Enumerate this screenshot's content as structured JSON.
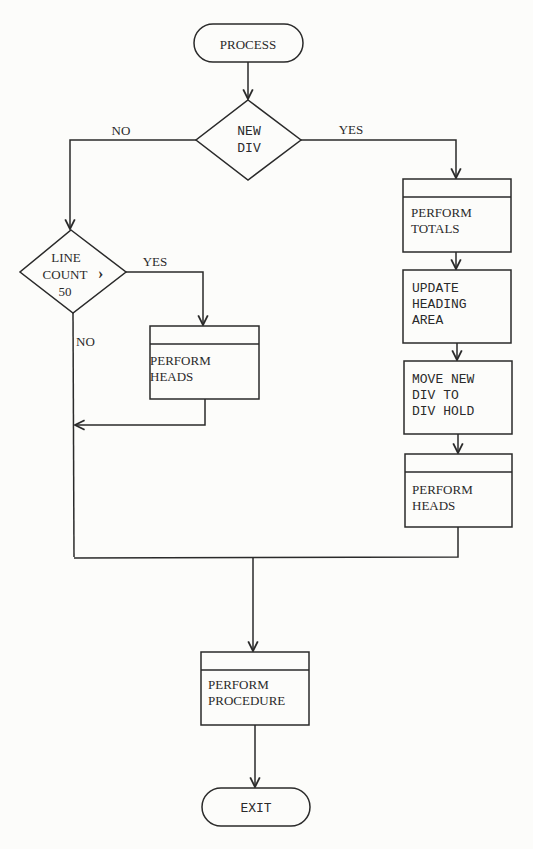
{
  "diagram": {
    "type": "flowchart",
    "nodes": {
      "start": {
        "shape": "terminal",
        "label": "PROCESS"
      },
      "new_div": {
        "shape": "decision",
        "lines": [
          "NEW",
          "DIV"
        ]
      },
      "line_count": {
        "shape": "decision",
        "lines": [
          "LINE",
          "COUNT >",
          "50"
        ],
        "line1": "LINE",
        "line2": "COUNT",
        "gt": "›",
        "line3": "50"
      },
      "perform_heads_left": {
        "shape": "predefined-process",
        "lines": [
          "PERFORM",
          "HEADS"
        ]
      },
      "perform_totals": {
        "shape": "predefined-process",
        "lines": [
          "PERFORM",
          "TOTALS"
        ]
      },
      "update_heading": {
        "shape": "process",
        "lines": [
          "UPDATE",
          "HEADING",
          "AREA"
        ]
      },
      "move_new_div": {
        "shape": "process",
        "lines": [
          "MOVE NEW",
          "DIV TO",
          "DIV HOLD"
        ]
      },
      "perform_heads_right": {
        "shape": "predefined-process",
        "lines": [
          "PERFORM",
          "HEADS"
        ]
      },
      "perform_procedure": {
        "shape": "predefined-process",
        "lines": [
          "PERFORM",
          "PROCEDURE"
        ]
      },
      "exit": {
        "shape": "terminal",
        "label": "EXIT"
      }
    },
    "edge_labels": {
      "new_div_no": "NO",
      "new_div_yes": "YES",
      "line_count_yes": "YES",
      "line_count_no": "NO"
    },
    "edges": [
      {
        "from": "start",
        "to": "new_div"
      },
      {
        "from": "new_div",
        "to": "line_count",
        "label": "NO"
      },
      {
        "from": "new_div",
        "to": "perform_totals",
        "label": "YES"
      },
      {
        "from": "line_count",
        "to": "perform_heads_left",
        "label": "YES"
      },
      {
        "from": "line_count",
        "to": "perform_procedure",
        "label": "NO"
      },
      {
        "from": "perform_heads_left",
        "to": "perform_procedure"
      },
      {
        "from": "perform_totals",
        "to": "update_heading"
      },
      {
        "from": "update_heading",
        "to": "move_new_div"
      },
      {
        "from": "move_new_div",
        "to": "perform_heads_right"
      },
      {
        "from": "perform_heads_right",
        "to": "perform_procedure"
      },
      {
        "from": "perform_procedure",
        "to": "exit"
      }
    ]
  }
}
